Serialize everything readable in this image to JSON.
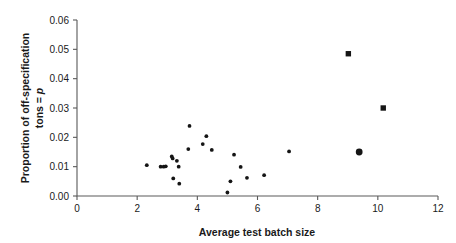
{
  "chart_data": {
    "type": "scatter",
    "title": "",
    "xlabel": "Average test batch size",
    "ylabel": "Proportion of off-specification tons = p",
    "ylabel_line1": "Proportion of off-specification",
    "ylabel_line2_prefix": "tons = ",
    "ylabel_line2_symbol": "p",
    "xlim": [
      0,
      12
    ],
    "ylim": [
      0,
      0.06
    ],
    "xticks": [
      0,
      2,
      4,
      6,
      8,
      10,
      12
    ],
    "xtick_labels": [
      "0",
      "2",
      "4",
      "6",
      "8",
      "10",
      "12"
    ],
    "yticks": [
      0.0,
      0.01,
      0.02,
      0.03,
      0.04,
      0.05,
      0.06
    ],
    "ytick_labels": [
      "0.00",
      "0.01",
      "0.02",
      "0.03",
      "0.04",
      "0.05",
      "0.06"
    ],
    "grid": false,
    "legend": false,
    "marker_color": "#151515",
    "axis_color": "#5a5a5a",
    "background": "#ffffff",
    "points": [
      {
        "x": 2.32,
        "y": 0.0105,
        "size": "small"
      },
      {
        "x": 2.78,
        "y": 0.01,
        "size": "small"
      },
      {
        "x": 2.88,
        "y": 0.01,
        "size": "small"
      },
      {
        "x": 2.95,
        "y": 0.0101,
        "size": "small"
      },
      {
        "x": 3.15,
        "y": 0.0135,
        "size": "small"
      },
      {
        "x": 3.18,
        "y": 0.0128,
        "size": "small"
      },
      {
        "x": 3.2,
        "y": 0.006,
        "size": "small"
      },
      {
        "x": 3.32,
        "y": 0.012,
        "size": "small"
      },
      {
        "x": 3.38,
        "y": 0.01,
        "size": "small"
      },
      {
        "x": 3.4,
        "y": 0.0042,
        "size": "small"
      },
      {
        "x": 3.7,
        "y": 0.016,
        "size": "small"
      },
      {
        "x": 3.74,
        "y": 0.0239,
        "size": "small"
      },
      {
        "x": 4.18,
        "y": 0.0177,
        "size": "small"
      },
      {
        "x": 4.3,
        "y": 0.0204,
        "size": "small"
      },
      {
        "x": 4.48,
        "y": 0.0157,
        "size": "small"
      },
      {
        "x": 5.0,
        "y": 0.0012,
        "size": "small"
      },
      {
        "x": 5.1,
        "y": 0.005,
        "size": "small"
      },
      {
        "x": 5.22,
        "y": 0.0141,
        "size": "small"
      },
      {
        "x": 5.44,
        "y": 0.0099,
        "size": "small"
      },
      {
        "x": 5.65,
        "y": 0.0062,
        "size": "small"
      },
      {
        "x": 6.22,
        "y": 0.0071,
        "size": "small"
      },
      {
        "x": 7.05,
        "y": 0.0152,
        "size": "small"
      },
      {
        "x": 9.02,
        "y": 0.0485,
        "size": "large-square"
      },
      {
        "x": 9.38,
        "y": 0.015,
        "size": "large-circle"
      },
      {
        "x": 10.18,
        "y": 0.03,
        "size": "large-square"
      }
    ]
  },
  "axes_geometry": {
    "plot_left": 77,
    "plot_right": 438,
    "plot_top": 20,
    "plot_bottom": 196
  }
}
